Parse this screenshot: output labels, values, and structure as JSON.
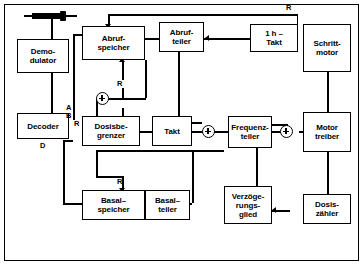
{
  "diagram": {
    "blocks": {
      "demodulator": "Demo-\ndulator",
      "decoder": "Decoder",
      "abrufspeicher": "Abruf-\nspeicher",
      "abrufteiler": "Abruf-\nteiler",
      "takt_1h": "1 h –\nTakt",
      "schrittmotor": "Schritt-\nmotor",
      "dosisbegrenzer": "Dosisbe-\ngrenzer",
      "takt": "Takt",
      "frequenzteiler": "Frequenz-\nteiler",
      "motortreiber": "Motor\ntreiber",
      "basalspeicher": "Basal–\nspeicher",
      "basalteiler": "Basal–\nteiler",
      "verzoegerungsglied": "Verzöge-\nrungs-\nglied",
      "dosiszaehler": "Dosis-\nzähler"
    },
    "labels": {
      "reset_top": "R",
      "reset_abruf": "R",
      "reset_dosis": "R",
      "reset_basal": "R",
      "signal_a": "A",
      "signal_b": "B",
      "signal_d": "D"
    },
    "symbols": {
      "sensor": "antenna-coil-symbol",
      "sum_1": "summing-junction",
      "sum_2": "summing-junction",
      "sum_3": "summing-junction",
      "sum_4": "summing-junction"
    }
  }
}
